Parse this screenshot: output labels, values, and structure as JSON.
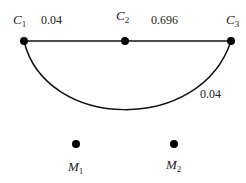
{
  "nodes": {
    "C1": {
      "name": "C",
      "sub": "1"
    },
    "C2": {
      "name": "C",
      "sub": "2"
    },
    "C3": {
      "name": "C",
      "sub": "3"
    },
    "M1": {
      "name": "M",
      "sub": "1"
    },
    "M2": {
      "name": "M",
      "sub": "2"
    }
  },
  "edges": {
    "c1_c2": {
      "label": "0.04"
    },
    "c2_c3": {
      "label": "0.696"
    },
    "c1_c3_arc": {
      "label": "0.04"
    }
  },
  "colors": {
    "stroke": "#111111",
    "node": "#000000"
  }
}
